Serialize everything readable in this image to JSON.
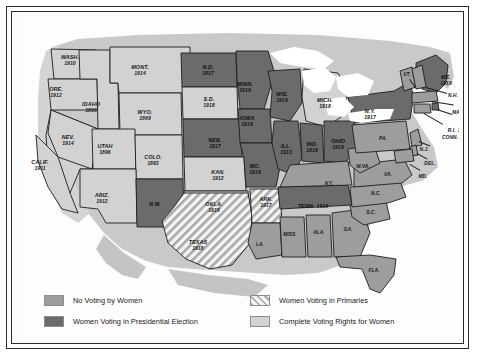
{
  "map": {
    "title": "Woman Suffrage in the United States",
    "ocean_color": "#ffffff",
    "land_outline_color": "#1d1d1d"
  },
  "categories": {
    "none": {
      "key": "no-voting",
      "label": "No Voting by Women",
      "color": "#9d9d9d"
    },
    "pres": {
      "key": "presidential",
      "label": "Women Voting in Presidential Election",
      "color": "#6b6b6b"
    },
    "primary": {
      "key": "primaries",
      "label": "Women Voting in Primaries",
      "color": "#e9e9e9"
    },
    "full": {
      "key": "complete-rights",
      "label": "Complete Voting Rights for Women",
      "color": "#d2d2d2"
    }
  },
  "legend": {
    "items": [
      {
        "label": "No Voting by Women",
        "swatch": "none"
      },
      {
        "label": "Women Voting in Primaries",
        "swatch": "primary"
      },
      {
        "label": "Women Voting in Presidential Election",
        "swatch": "pres"
      },
      {
        "label": "Complete Voting Rights for Women",
        "swatch": "full"
      }
    ]
  },
  "states": [
    {
      "id": "WA",
      "name": "WASH.",
      "year": "1910",
      "status": "full",
      "x": 52,
      "y": 43
    },
    {
      "id": "OR",
      "name": "ORE.",
      "year": "1912",
      "status": "full",
      "x": 38,
      "y": 75
    },
    {
      "id": "ID",
      "name": "IDAHO",
      "year": "1896",
      "status": "full",
      "x": 73,
      "y": 90
    },
    {
      "id": "MT",
      "name": "MONT.",
      "year": "1914",
      "status": "full",
      "x": 122,
      "y": 53
    },
    {
      "id": "WY",
      "name": "WYO.",
      "year": "1869",
      "status": "full",
      "x": 127,
      "y": 98
    },
    {
      "id": "ND",
      "name": "N.D.",
      "year": "1917",
      "status": "pres",
      "x": 190,
      "y": 53
    },
    {
      "id": "SD",
      "name": "S.D.",
      "year": "1918",
      "status": "full",
      "x": 191,
      "y": 85
    },
    {
      "id": "NE",
      "name": "NEB.",
      "year": "1917",
      "status": "pres",
      "x": 197,
      "y": 126
    },
    {
      "id": "KS",
      "name": "KAN.",
      "year": "1912",
      "status": "full",
      "x": 200,
      "y": 158
    },
    {
      "id": "MN",
      "name": "MINN.",
      "year": "1919",
      "status": "pres",
      "x": 227,
      "y": 70
    },
    {
      "id": "IA",
      "name": "IOWA",
      "year": "1919",
      "status": "pres",
      "x": 229,
      "y": 104
    },
    {
      "id": "MO",
      "name": "MO.",
      "year": "1919",
      "status": "pres",
      "x": 237,
      "y": 152
    },
    {
      "id": "WI",
      "name": "WIS.",
      "year": "1919",
      "status": "pres",
      "x": 264,
      "y": 80
    },
    {
      "id": "MI",
      "name": "MICH.",
      "year": "1918",
      "status": "pres",
      "x": 307,
      "y": 86
    },
    {
      "id": "IL",
      "name": "ILL.",
      "year": "1913",
      "status": "pres",
      "x": 268,
      "y": 132
    },
    {
      "id": "IN",
      "name": "IND.",
      "year": "1919",
      "status": "pres",
      "x": 294,
      "y": 130
    },
    {
      "id": "OH",
      "name": "OHIO",
      "year": "1919",
      "status": "pres",
      "x": 320,
      "y": 127
    },
    {
      "id": "NV",
      "name": "NEV.",
      "year": "1914",
      "status": "full",
      "x": 50,
      "y": 123
    },
    {
      "id": "UT",
      "name": "UTAH",
      "year": "1896",
      "status": "full",
      "x": 87,
      "y": 132
    },
    {
      "id": "CO",
      "name": "COLO.",
      "year": "1893",
      "status": "full",
      "x": 135,
      "y": 143
    },
    {
      "id": "CA",
      "name": "CALIF.",
      "year": "1911",
      "status": "full",
      "x": 22,
      "y": 148
    },
    {
      "id": "AZ",
      "name": "ARIZ.",
      "year": "1912",
      "status": "full",
      "x": 84,
      "y": 181
    },
    {
      "id": "NM",
      "name": "N.M.",
      "year": "",
      "status": "pres",
      "x": 137,
      "y": 188
    },
    {
      "id": "OK",
      "name": "OKLA.",
      "year": "1918",
      "status": "full",
      "x": 196,
      "y": 190
    },
    {
      "id": "TX",
      "name": "TEXAS",
      "year": "1918",
      "status": "primary",
      "x": 180,
      "y": 228
    },
    {
      "id": "AR",
      "name": "ARK.",
      "year": "1917",
      "status": "primary",
      "x": 248,
      "y": 185
    },
    {
      "id": "LA",
      "name": "LA.",
      "year": "",
      "status": "none",
      "x": 242,
      "y": 228
    },
    {
      "id": "MS",
      "name": "MISS.",
      "year": "",
      "status": "none",
      "x": 272,
      "y": 218
    },
    {
      "id": "AL",
      "name": "ALA.",
      "year": "",
      "status": "none",
      "x": 301,
      "y": 216
    },
    {
      "id": "GA",
      "name": "GA.",
      "year": "",
      "status": "none",
      "x": 330,
      "y": 213
    },
    {
      "id": "FL",
      "name": "FLA.",
      "year": "",
      "status": "none",
      "x": 356,
      "y": 254
    },
    {
      "id": "TN",
      "name": "TENN.",
      "year": "1919",
      "status": "pres",
      "x": 295,
      "y": 186
    },
    {
      "id": "KY",
      "name": "KY.",
      "year": "",
      "status": "none",
      "x": 311,
      "y": 167
    },
    {
      "id": "SC",
      "name": "S.C.",
      "year": "",
      "status": "none",
      "x": 353,
      "y": 196
    },
    {
      "id": "NC",
      "name": "N.C.",
      "year": "",
      "status": "none",
      "x": 358,
      "y": 177
    },
    {
      "id": "VA",
      "name": "VA.",
      "year": "",
      "status": "none",
      "x": 370,
      "y": 158
    },
    {
      "id": "WV",
      "name": "W.VA.",
      "year": "",
      "status": "none",
      "x": 345,
      "y": 150
    },
    {
      "id": "PA",
      "name": "PA.",
      "year": "",
      "status": "none",
      "x": 365,
      "y": 122
    },
    {
      "id": "NY",
      "name": "N.Y.",
      "year": "1917",
      "status": "pres",
      "x": 352,
      "y": 97
    },
    {
      "id": "VT",
      "name": "VT.",
      "year": "",
      "status": "none",
      "x": 389,
      "y": 58
    },
    {
      "id": "ME",
      "name": "ME.",
      "year": "1919",
      "status": "pres",
      "x": 428,
      "y": 63
    },
    {
      "id": "NH",
      "name": "N.H.",
      "year": "",
      "status": "none",
      "x": 435,
      "y": 79
    },
    {
      "id": "MA",
      "name": "MASS.",
      "year": "",
      "status": "none",
      "x": 442,
      "y": 96
    },
    {
      "id": "RI",
      "name": "R.I.",
      "year": "1917",
      "status": "pres",
      "x": 440,
      "y": 110
    },
    {
      "id": "CT",
      "name": "CONN.",
      "year": "",
      "status": "none",
      "x": 432,
      "y": 121
    },
    {
      "id": "NJ",
      "name": "N.J.",
      "year": "",
      "status": "none",
      "x": 406,
      "y": 133
    },
    {
      "id": "DE",
      "name": "DEL.",
      "year": "",
      "status": "none",
      "x": 412,
      "y": 147
    },
    {
      "id": "MD",
      "name": "MD.",
      "year": "",
      "status": "none",
      "x": 405,
      "y": 160
    }
  ]
}
